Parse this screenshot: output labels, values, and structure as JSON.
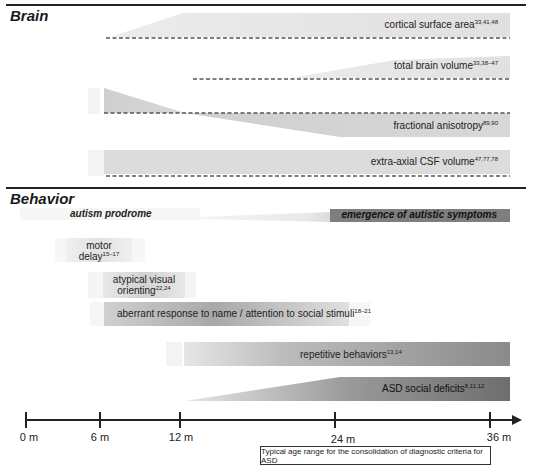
{
  "sections": {
    "brain": {
      "title": "Brain"
    },
    "behavior": {
      "title": "Behavior"
    }
  },
  "brain_tracks": [
    {
      "label": "cortical surface area",
      "refs": "33,41,48",
      "shape": "increase"
    },
    {
      "label": "total brain volume",
      "refs": "33,38–47",
      "shape": "increase"
    },
    {
      "label": "fractional anisotropy",
      "refs": "89,90",
      "shape": "higher-then-lower"
    },
    {
      "label": "extra-axial CSF volume",
      "refs": "47,77,78",
      "shape": "elevated"
    }
  ],
  "behavior_tracks": {
    "prodrome": {
      "label": "autism prodrome"
    },
    "emergence": {
      "label": "emergence of autistic symptoms"
    },
    "motor_delay": {
      "label_line1": "motor",
      "label_line2": "delay",
      "refs": "15–17"
    },
    "visual_orienting": {
      "label_line1": "atypical visual",
      "label_line2": "orienting",
      "refs": "22,24"
    },
    "aberrant_response": {
      "label": "aberrant response to name / attention to social stimuli",
      "refs": "18–21"
    },
    "repetitive": {
      "label": "repetitive behaviors",
      "refs": "13,14"
    },
    "social_deficits": {
      "label": "ASD social deficits",
      "refs": "8,11,12"
    }
  },
  "axis": {
    "ticks": [
      {
        "label": "0 m",
        "month": 0
      },
      {
        "label": "6 m",
        "month": 6
      },
      {
        "label": "12 m",
        "month": 12
      },
      {
        "label": "24 m",
        "month": 24
      },
      {
        "label": "36 m",
        "month": 36
      }
    ]
  },
  "diagnostic_box": {
    "label": "Typical age range for the consolidation of diagnostic criteria for ASD"
  },
  "colors": {
    "line": "#222222",
    "fill_light": "#e4e4e4",
    "fill_mid": "#bdbdbd",
    "fill_dark": "#7a7a7a"
  }
}
